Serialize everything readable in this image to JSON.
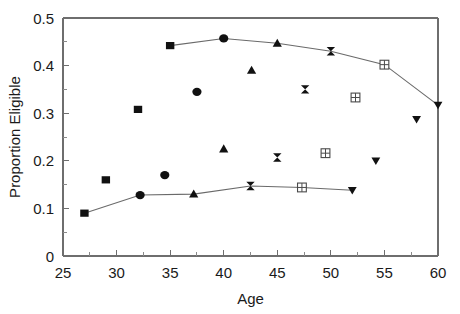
{
  "chart_data": {
    "type": "scatter",
    "title": "",
    "xlabel": "Age",
    "ylabel": "Proportion Eligible",
    "xlim": [
      25,
      60
    ],
    "ylim": [
      0,
      0.5
    ],
    "grid": false,
    "legend": "none",
    "x_ticks_major": [
      25,
      30,
      35,
      40,
      45,
      50,
      55,
      60
    ],
    "x_tick_labels": [
      "25",
      "30",
      "35",
      "40",
      "45",
      "50",
      "55",
      "60"
    ],
    "x_ticks_minor": [
      27.5,
      32.5,
      37.5,
      42.5,
      47.5,
      52.5,
      57.5
    ],
    "y_ticks_major": [
      0,
      0.1,
      0.2,
      0.3,
      0.4,
      0.5
    ],
    "y_tick_labels": [
      "0",
      "0.1",
      "0.2",
      "0.3",
      "0.4",
      "0.5"
    ],
    "y_ticks_minor": [
      0.05,
      0.15,
      0.25,
      0.35,
      0.45
    ],
    "series": [
      {
        "name": "Cohort 1",
        "marker": "filled-square",
        "points": [
          {
            "x": 27.0,
            "y": 0.09
          },
          {
            "x": 29.0,
            "y": 0.16
          },
          {
            "x": 32.0,
            "y": 0.308
          },
          {
            "x": 35.0,
            "y": 0.442
          }
        ]
      },
      {
        "name": "Cohort 2",
        "marker": "filled-circle",
        "points": [
          {
            "x": 32.2,
            "y": 0.128
          },
          {
            "x": 34.5,
            "y": 0.17
          },
          {
            "x": 37.5,
            "y": 0.345
          },
          {
            "x": 40.0,
            "y": 0.457
          }
        ]
      },
      {
        "name": "Cohort 3",
        "marker": "filled-triangle-up",
        "points": [
          {
            "x": 37.2,
            "y": 0.13
          },
          {
            "x": 40.0,
            "y": 0.225
          },
          {
            "x": 42.6,
            "y": 0.39
          },
          {
            "x": 45.0,
            "y": 0.447
          }
        ]
      },
      {
        "name": "Cohort 4",
        "marker": "bowtie",
        "points": [
          {
            "x": 42.5,
            "y": 0.147
          },
          {
            "x": 45.0,
            "y": 0.207
          },
          {
            "x": 47.6,
            "y": 0.35
          },
          {
            "x": 50.0,
            "y": 0.43
          }
        ]
      },
      {
        "name": "Cohort 5",
        "marker": "crossed-square",
        "points": [
          {
            "x": 47.3,
            "y": 0.144
          },
          {
            "x": 49.5,
            "y": 0.216
          },
          {
            "x": 52.3,
            "y": 0.333
          },
          {
            "x": 55.0,
            "y": 0.402
          }
        ]
      },
      {
        "name": "Cohort 6",
        "marker": "filled-triangle-down",
        "points": [
          {
            "x": 52.0,
            "y": 0.138
          },
          {
            "x": 54.2,
            "y": 0.2
          },
          {
            "x": 58.0,
            "y": 0.287
          },
          {
            "x": 60.0,
            "y": 0.317
          }
        ]
      }
    ],
    "connector_line": {
      "name": "cross-sectional-trend",
      "points": [
        {
          "x": 27.0,
          "y": 0.09
        },
        {
          "x": 32.2,
          "y": 0.128
        },
        {
          "x": 37.2,
          "y": 0.13
        },
        {
          "x": 42.5,
          "y": 0.147
        },
        {
          "x": 47.3,
          "y": 0.144
        },
        {
          "x": 52.0,
          "y": 0.138
        }
      ]
    },
    "connector_line_upper": {
      "name": "cohort-peak-trend",
      "points": [
        {
          "x": 35.0,
          "y": 0.442
        },
        {
          "x": 40.0,
          "y": 0.457
        },
        {
          "x": 45.0,
          "y": 0.447
        },
        {
          "x": 50.0,
          "y": 0.43
        },
        {
          "x": 55.0,
          "y": 0.402
        },
        {
          "x": 60.0,
          "y": 0.317
        }
      ]
    },
    "colors": {
      "marker_fill": "#111111",
      "marker_open_stroke": "#4a4a4a",
      "line": "#6a6a6a",
      "axis": "#6e6e6e",
      "text": "#1a1a1a",
      "background": "#ffffff"
    }
  }
}
